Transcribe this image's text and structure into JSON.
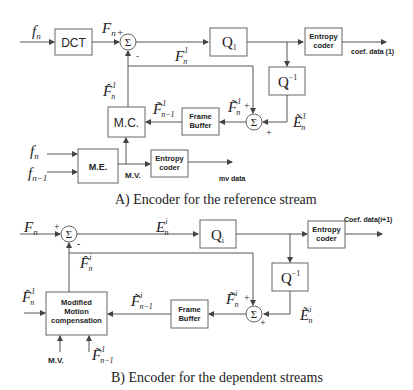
{
  "diagram_a": {
    "caption": "A) Encoder for the reference stream",
    "blocks": {
      "dct": "DCT",
      "q": "Q",
      "q_sub": "1",
      "qinv": "Q",
      "qinv_sub": "1",
      "qinv_sup": "−1",
      "entropy_coef_1": "Entropy",
      "entropy_coef_2": "coder",
      "frame_buffer_1": "Frame",
      "frame_buffer_2": "Buffer",
      "mc": "M.C.",
      "me": "M.E.",
      "entropy_mv_1": "Entropy",
      "entropy_mv_2": "coder",
      "sum1": "Σ",
      "sum2": "Σ"
    },
    "signals": {
      "f_n": "f",
      "f_n_sub": "n",
      "F_n": "F",
      "F_n_sub": "n",
      "F1_n": "F",
      "F1_n_sup": "1",
      "F1_n_sub": "n",
      "Fhat1_n": "F̂",
      "Fhat1_n_sup": "1",
      "Fhat1_n_sub": "n",
      "Ftilde1_nm1": "F̃",
      "Ftilde1_nm1_sup": "1",
      "Ftilde1_nm1_sub": "n−1",
      "Ftilde1_n": "F̃",
      "Ftilde1_n_sup": "1",
      "Ftilde1_n_sub": "n",
      "Etilde1_n": "Ẽ",
      "Etilde1_n_sup": "1",
      "Etilde1_n_sub": "n",
      "f_n2": "f",
      "f_n2_sub": "n",
      "f_nm1": "f",
      "f_nm1_sub": "n−1",
      "mv": "M.V.",
      "coef_out": "coef. data (1)",
      "mv_out": "mv data",
      "plus": "+",
      "minus": "-"
    }
  },
  "diagram_b": {
    "caption": "B) Encoder for the dependent streams",
    "blocks": {
      "q": "Q",
      "q_sub": "i",
      "qinv": "Q",
      "qinv_sub": "i",
      "qinv_sup": "−1",
      "entropy_1": "Entropy",
      "entropy_2": "coder",
      "frame_buffer_1": "Frame",
      "frame_buffer_2": "Buffer",
      "mmc_1": "Modified",
      "mmc_2": "Motion",
      "mmc_3": "compensation",
      "sum1": "Σ",
      "sum2": "Σ"
    },
    "signals": {
      "F_n": "F",
      "F_n_sub": "n",
      "Ei_n": "E",
      "Ei_n_sup": "i",
      "Ei_n_sub": "n",
      "Fhati_n": "F̂",
      "Fhati_n_sup": "i",
      "Fhati_n_sub": "n",
      "Fhat1_n": "F̂",
      "Fhat1_n_sup": "1",
      "Fhat1_n_sub": "n",
      "Ftildei_nm1": "F̃",
      "Ftildei_nm1_sup": "i",
      "Ftildei_nm1_sub": "n−1",
      "Ftildei_n": "F̃",
      "Ftildei_n_sup": "i",
      "Ftildei_n_sub": "n",
      "Etildei_n": "Ẽ",
      "Etildei_n_sup": "i",
      "Etildei_n_sub": "n",
      "Ftilde1_nm1": "F̃",
      "Ftilde1_nm1_sup": "1",
      "Ftilde1_nm1_sub": "n−1",
      "mv": "M.V.",
      "coef_out": "Coef. data(i+1)",
      "plus": "+",
      "minus": "-"
    }
  }
}
